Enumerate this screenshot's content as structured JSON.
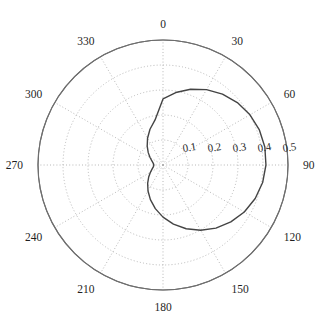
{
  "figure": {
    "type": "polar-plot",
    "background": "#ffffff",
    "width": 326,
    "height": 330
  },
  "axes": {
    "center_px": [
      163,
      165
    ],
    "outer_radius_px": 125,
    "grid_color": "#9a9a9a",
    "grid_dotted_color": "#b0b0b0",
    "outer_circle_color": "#6e6e6e",
    "curve_color": "#444444",
    "angle_direction": "clockwise",
    "angle_zero_at": "top"
  },
  "chart_data": {
    "type": "line",
    "title": "",
    "xlabel": "",
    "ylabel": "",
    "coordinate_system": "polar",
    "theta_unit": "degrees",
    "theta_zero_location": "N",
    "theta_direction": "clockwise",
    "grid": true,
    "rlim": [
      0,
      0.5
    ],
    "r_ticks": [
      0.1,
      0.2,
      0.3,
      0.4,
      0.5
    ],
    "r_tick_labels": [
      "0.1",
      "0.2",
      "0.3",
      "0.4",
      "0.5"
    ],
    "theta_ticks": [
      0,
      30,
      60,
      90,
      120,
      150,
      180,
      210,
      240,
      270,
      300,
      330
    ],
    "theta_tick_labels": [
      "0",
      "30",
      "60",
      "90",
      "120",
      "150",
      "180",
      "210",
      "240",
      "270",
      "300",
      "330"
    ],
    "legend": null,
    "series": [
      {
        "name": "cardioid",
        "model": "r = 0.21 * (1 + cos(theta - 75deg))",
        "peak_r": 0.42,
        "peak_theta_deg": 75,
        "cusp_theta_deg": 255,
        "theta": [
          0,
          10,
          20,
          30,
          40,
          50,
          60,
          70,
          80,
          90,
          100,
          110,
          120,
          130,
          140,
          150,
          160,
          170,
          180,
          190,
          200,
          210,
          220,
          230,
          240,
          250,
          260,
          270,
          280,
          290,
          300,
          310,
          320,
          330,
          340,
          350,
          360
        ],
        "r": [
          0.2643,
          0.2943,
          0.3225,
          0.348,
          0.3701,
          0.3882,
          0.4017,
          0.4103,
          0.4137,
          0.4118,
          0.4047,
          0.3925,
          0.3755,
          0.3543,
          0.3294,
          0.3015,
          0.2715,
          0.2401,
          0.2084,
          0.1772,
          0.1474,
          0.1199,
          0.0955,
          0.0747,
          0.0581,
          0.046,
          0.0388,
          0.0366,
          0.0394,
          0.0472,
          0.0598,
          0.077,
          0.0984,
          0.1236,
          0.1521,
          0.1832,
          0.2643
        ]
      }
    ]
  },
  "r_labels": [
    {
      "text": "0.1",
      "r": 0.1
    },
    {
      "text": "0.2",
      "r": 0.2
    },
    {
      "text": "0.3",
      "r": 0.3
    },
    {
      "text": "0.4",
      "r": 0.4
    },
    {
      "text": "0.5",
      "r": 0.5
    }
  ],
  "angle_labels": [
    {
      "text": "0",
      "deg": 0
    },
    {
      "text": "30",
      "deg": 30
    },
    {
      "text": "60",
      "deg": 60
    },
    {
      "text": "90",
      "deg": 90
    },
    {
      "text": "120",
      "deg": 120
    },
    {
      "text": "150",
      "deg": 150
    },
    {
      "text": "180",
      "deg": 180
    },
    {
      "text": "210",
      "deg": 210
    },
    {
      "text": "240",
      "deg": 240
    },
    {
      "text": "270",
      "deg": 270
    },
    {
      "text": "300",
      "deg": 300
    },
    {
      "text": "330",
      "deg": 330
    }
  ]
}
